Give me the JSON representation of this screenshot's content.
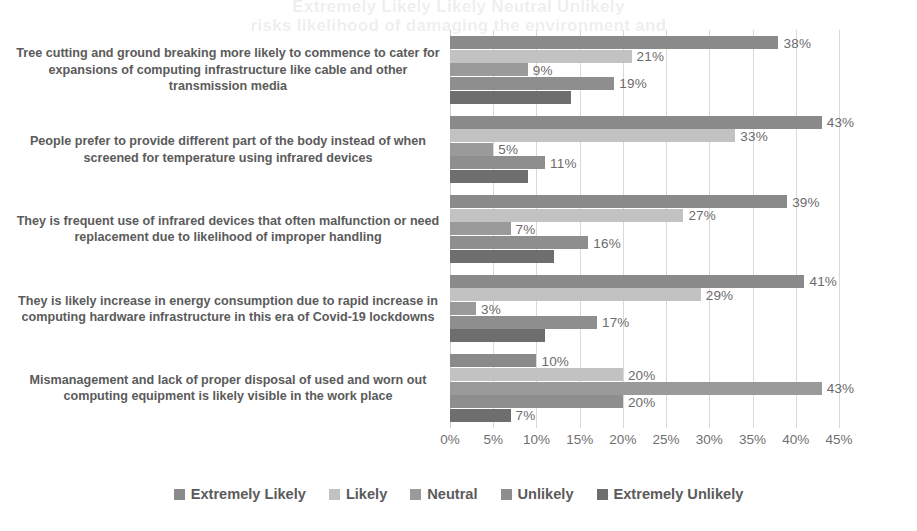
{
  "ghost_text": {
    "line_a": "Extremely Likely   Likely   Neutral   Unlikely",
    "line_b": "risks likelihood of damaging the environment and"
  },
  "axis": {
    "ticks": [
      "0%",
      "5%",
      "10%",
      "15%",
      "20%",
      "25%",
      "30%",
      "35%",
      "40%",
      "45%"
    ],
    "min": 0,
    "max": 45,
    "step": 5
  },
  "legend": {
    "items": [
      {
        "label": "Extremely Likely",
        "color": "#8a8a8a"
      },
      {
        "label": "Likely",
        "color": "#c2c2c2"
      },
      {
        "label": "Neutral",
        "color": "#9a9a9a"
      },
      {
        "label": "Unlikely",
        "color": "#8e8e8e"
      },
      {
        "label": "Extremely Unlikely",
        "color": "#6e6e6e"
      }
    ]
  },
  "chart_data": {
    "type": "bar",
    "orientation": "horizontal",
    "title": "",
    "xlabel": "",
    "ylabel": "",
    "xlim": [
      0,
      45
    ],
    "grid": true,
    "legend_position": "bottom",
    "categories": [
      "Tree cutting and ground breaking more likely to commence to cater for expansions of computing infrastructure like cable and other transmission media",
      "People prefer to provide different part of the body instead of when screened for temperature using infrared devices",
      "They is frequent use of infrared devices that often malfunction or need replacement due to likelihood of improper handling",
      "They is likely increase in energy consumption due to rapid increase in computing hardware infrastructure in this era of Covid-19 lockdowns",
      "Mismanagement and lack of proper disposal of used and worn out computing equipment is likely visible in the work place"
    ],
    "series": [
      {
        "name": "Extremely Likely",
        "color": "#8a8a8a",
        "values": [
          38,
          43,
          39,
          41,
          10
        ],
        "labels": [
          "38%",
          "43%",
          "39%",
          "41%",
          "10%"
        ]
      },
      {
        "name": "Likely",
        "color": "#c2c2c2",
        "values": [
          21,
          33,
          27,
          29,
          20
        ],
        "labels": [
          "21%",
          "33%",
          "27%",
          "29%",
          "20%"
        ]
      },
      {
        "name": "Neutral",
        "color": "#9a9a9a",
        "values": [
          9,
          5,
          7,
          3,
          43
        ],
        "labels": [
          "9%",
          "5%",
          "7%",
          "3%",
          "43%"
        ]
      },
      {
        "name": "Unlikely",
        "color": "#8e8e8e",
        "values": [
          19,
          11,
          16,
          17,
          20
        ],
        "labels": [
          "19%",
          "11%",
          "16%",
          "17%",
          "20%"
        ]
      },
      {
        "name": "Extremely Unlikely",
        "color": "#6e6e6e",
        "values": [
          14,
          9,
          12,
          11,
          7
        ],
        "labels": [
          "",
          "",
          "",
          "",
          "7%"
        ]
      }
    ]
  }
}
